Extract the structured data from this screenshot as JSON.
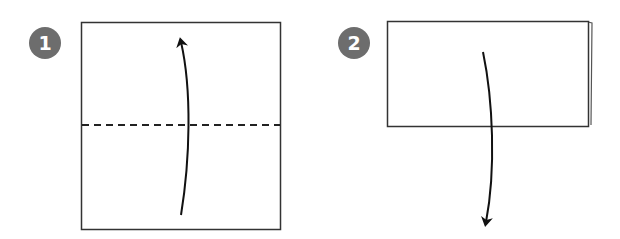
{
  "steps": [
    {
      "number": "1",
      "description": "Square paper with horizontal dashed valley fold line at middle; curved arrow pointing up (fold bottom half up)",
      "paper": {
        "x": 81,
        "y": 22,
        "width": 199,
        "height": 207
      },
      "fold_line": {
        "y": 125,
        "style": "dashed"
      },
      "arrow": {
        "direction": "up",
        "from": [
          181,
          215
        ],
        "to": [
          181,
          38
        ]
      }
    },
    {
      "number": "2",
      "description": "Folded rectangle (two layers, back layer slightly offset right); curved arrow pointing down (unfold)",
      "paper": {
        "x": 387,
        "y": 21,
        "width": 201,
        "height": 105
      },
      "arrow": {
        "direction": "down",
        "from": [
          483,
          52
        ],
        "to": [
          484,
          226
        ]
      }
    }
  ],
  "colors": {
    "badge": "#6d6d6d",
    "line": "#222222",
    "background": "#ffffff"
  }
}
